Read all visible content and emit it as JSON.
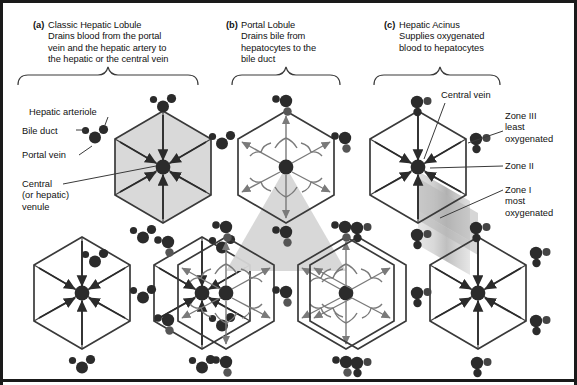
{
  "figure": {
    "panels": [
      {
        "tag": "(a)",
        "name": "Classic Hepatic Lobule",
        "description_lines": [
          "Drains blood from the portal",
          "vein and the hepatic artery to",
          "the hepatic or the central vein"
        ]
      },
      {
        "tag": "(b)",
        "name": "Portal Lobule",
        "description_lines": [
          "Drains bile from",
          "hepatocytes to the",
          "bile duct"
        ]
      },
      {
        "tag": "(c)",
        "name": "Hepatic Acinus",
        "description_lines": [
          "Supplies oxygenated",
          "blood to hepatocytes"
        ]
      }
    ]
  },
  "labels_left": [
    {
      "id": "hepatic-arteriole",
      "text": "Hepatic arteriole"
    },
    {
      "id": "bile-duct",
      "text": "Bile duct"
    },
    {
      "id": "portal-vein",
      "text": "Portal vein"
    },
    {
      "id": "central-venule",
      "lines": [
        "Central",
        "(or hepatic)",
        "venule"
      ]
    }
  ],
  "labels_right": [
    {
      "id": "central-vein",
      "text": "Central vein"
    },
    {
      "id": "zone-3",
      "lines": [
        "Zone III",
        "least",
        "oxygenated"
      ]
    },
    {
      "id": "zone-2",
      "lines": [
        "Zone II"
      ]
    },
    {
      "id": "zone-1",
      "lines": [
        "Zone I",
        "most",
        "oxygenated"
      ]
    }
  ],
  "colors": {
    "ink": "#262626",
    "outline": "#3a3a3a",
    "lobule_fill": "#d9d9d9",
    "portal_triangle_fill": "#d0d0d0",
    "acinus_zone1": "#a8a8a8",
    "acinus_zone2": "#c4c4c4",
    "acinus_zone3": "#dedede",
    "arrow_blood": "#2b2b2b",
    "arrow_bile": "#7a7a7a",
    "frame": "#1a1a1a"
  },
  "legend_elements": {
    "portal_triad": "three dots: portal vein (large), bile duct (small left), hepatic arteriole (medium right)",
    "central_vein_dot": "single large dot at hexagon centre"
  }
}
